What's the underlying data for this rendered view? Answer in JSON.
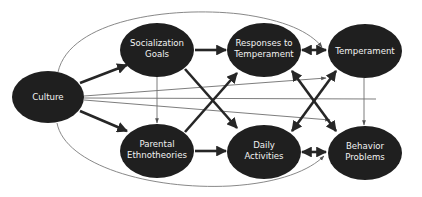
{
  "diagram": {
    "type": "path-model",
    "nodes": [
      {
        "id": "culture",
        "lines": [
          "Culture"
        ]
      },
      {
        "id": "socialization-goals",
        "lines": [
          "Socialization",
          "Goals"
        ]
      },
      {
        "id": "parental-ethnotheories",
        "lines": [
          "Parental",
          "Ethnotheories"
        ]
      },
      {
        "id": "responses-to-temperament",
        "lines": [
          "Responses to",
          "Temperament"
        ]
      },
      {
        "id": "daily-activities",
        "lines": [
          "Daily",
          "Activities"
        ]
      },
      {
        "id": "temperament",
        "lines": [
          "Temperament"
        ]
      },
      {
        "id": "behavior-problems",
        "lines": [
          "Behavior",
          "Problems"
        ]
      }
    ],
    "edges": [
      {
        "from": "Culture",
        "to": "Socialization Goals",
        "style": "thick",
        "direction": "forward"
      },
      {
        "from": "Culture",
        "to": "Parental Ethnotheories",
        "style": "thick",
        "direction": "forward"
      },
      {
        "from": "Socialization Goals",
        "to": "Parental Ethnotheories",
        "style": "thin",
        "direction": "forward"
      },
      {
        "from": "Socialization Goals",
        "to": "Responses to Temperament",
        "style": "thick",
        "direction": "forward"
      },
      {
        "from": "Socialization Goals",
        "to": "Daily Activities",
        "style": "thick",
        "direction": "forward"
      },
      {
        "from": "Parental Ethnotheories",
        "to": "Responses to Temperament",
        "style": "thick",
        "direction": "forward"
      },
      {
        "from": "Parental Ethnotheories",
        "to": "Daily Activities",
        "style": "thick",
        "direction": "forward"
      },
      {
        "from": "Responses to Temperament",
        "to": "Temperament",
        "style": "thick",
        "direction": "both"
      },
      {
        "from": "Responses to Temperament",
        "to": "Behavior Problems",
        "style": "thick",
        "direction": "both"
      },
      {
        "from": "Daily Activities",
        "to": "Temperament",
        "style": "thick",
        "direction": "both"
      },
      {
        "from": "Daily Activities",
        "to": "Behavior Problems",
        "style": "thick",
        "direction": "both"
      },
      {
        "from": "Temperament",
        "to": "Behavior Problems",
        "style": "thin",
        "direction": "forward"
      },
      {
        "from": "Culture",
        "to": "Temperament",
        "style": "thin",
        "direction": "forward"
      },
      {
        "from": "Culture",
        "to": "Behavior Problems",
        "style": "thin",
        "direction": "forward"
      },
      {
        "from": "Culture",
        "to": "Behavior Problems (right edge)",
        "style": "thin",
        "direction": "forward"
      },
      {
        "from": "Culture",
        "to": "Temperament",
        "style": "curved-thin",
        "direction": "forward"
      },
      {
        "from": "Culture",
        "to": "Behavior Problems",
        "style": "curved-thin",
        "direction": "forward"
      }
    ]
  }
}
